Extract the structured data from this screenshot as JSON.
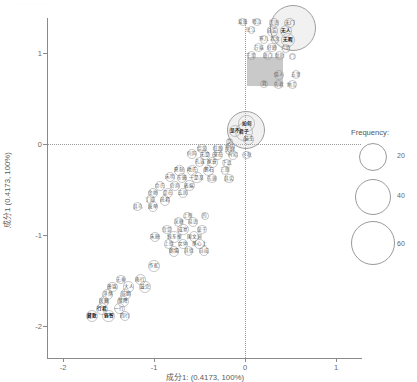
{
  "chart_data": {
    "type": "scatter",
    "title": "",
    "xlabel": "成分1: (0.4173, 100%)",
    "ylabel": "成分1 (0.4173, 100%)",
    "xlim": [
      -2.35,
      1.45
    ],
    "ylim": [
      -2.35,
      1.45
    ],
    "xticks": [
      "-2",
      "-1",
      "0",
      "1"
    ],
    "xtick_values": [
      -2,
      -1,
      0,
      1
    ],
    "yticks": [
      "1",
      "0",
      "-1",
      "-2"
    ],
    "ytick_values": [
      1,
      0,
      -1,
      -2
    ],
    "grid": false,
    "reference_lines": {
      "horizontal_at": 0,
      "vertical_at": 0,
      "style": "dotted"
    },
    "size_encoding": "Frequency",
    "legend": {
      "title": "Frequency:",
      "position": "right",
      "entries": [
        {
          "label": "20",
          "size": 20
        },
        {
          "label": "40",
          "size": 40
        },
        {
          "label": "60",
          "size": 60
        }
      ]
    },
    "points": [
      {
        "label": "爱耻",
        "x": -0.02,
        "y": 1.34,
        "freq": 6
      },
      {
        "label": "啜泣",
        "x": 0.13,
        "y": 1.34,
        "freq": 6
      },
      {
        "label": "言语",
        "x": 0.32,
        "y": 1.33,
        "freq": 10
      },
      {
        "label": "无门",
        "x": 0.49,
        "y": 1.33,
        "freq": 12
      },
      {
        "label": "往江",
        "x": 0.07,
        "y": 1.25,
        "freq": 6
      },
      {
        "label": "自忘",
        "x": 0.3,
        "y": 1.24,
        "freq": 14
      },
      {
        "label": "无人",
        "x": 0.45,
        "y": 1.24,
        "freq": 16
      },
      {
        "label": "寒儿",
        "x": 0.21,
        "y": 1.15,
        "freq": 8
      },
      {
        "label": "北文",
        "x": 0.33,
        "y": 1.15,
        "freq": 8
      },
      {
        "label": "无暇",
        "x": 0.47,
        "y": 1.14,
        "freq": 20
      },
      {
        "label": "万端",
        "x": 0.15,
        "y": 1.06,
        "freq": 8
      },
      {
        "label": "好峰",
        "x": 0.3,
        "y": 1.06,
        "freq": 10
      },
      {
        "label": "六官",
        "x": 0.45,
        "y": 1.05,
        "freq": 8
      },
      {
        "label": "千里",
        "x": 0.07,
        "y": 0.97,
        "freq": 8
      },
      {
        "label": "旅门",
        "x": 0.25,
        "y": 0.97,
        "freq": 8
      },
      {
        "label": "新时",
        "x": 0.38,
        "y": 0.97,
        "freq": 8
      },
      {
        "label": "门",
        "x": 0.52,
        "y": 0.96,
        "freq": 4
      },
      {
        "label": "儒人",
        "x": 0.37,
        "y": 0.76,
        "freq": 10
      },
      {
        "label": "去里",
        "x": 0.56,
        "y": 0.76,
        "freq": 8
      },
      {
        "label": "舞",
        "x": 0.21,
        "y": 0.66,
        "freq": 6
      },
      {
        "label": "先君",
        "x": 0.37,
        "y": 0.65,
        "freq": 8
      },
      {
        "label": "纳言",
        "x": 0.52,
        "y": 0.65,
        "freq": 8
      },
      {
        "label": "如何",
        "x": 0.02,
        "y": 0.22,
        "freq": 30
      },
      {
        "label": "君子",
        "x": -0.01,
        "y": 0.13,
        "freq": 34
      },
      {
        "label": "是不",
        "x": -0.11,
        "y": 0.14,
        "freq": 16
      },
      {
        "label": "脑王",
        "x": 0.04,
        "y": 0.05,
        "freq": 14
      },
      {
        "label": "是",
        "x": -0.17,
        "y": 0.02,
        "freq": 6
      },
      {
        "label": "约内",
        "x": -0.16,
        "y": -0.03,
        "freq": 8
      },
      {
        "label": "绍游",
        "x": -0.47,
        "y": -0.05,
        "freq": 10
      },
      {
        "label": "狂跟",
        "x": -0.3,
        "y": -0.05,
        "freq": 10
      },
      {
        "label": "夫妇",
        "x": -0.17,
        "y": -0.07,
        "freq": 8
      },
      {
        "label": "何阵",
        "x": -0.58,
        "y": -0.11,
        "freq": 10
      },
      {
        "label": "无是",
        "x": -0.44,
        "y": -0.12,
        "freq": 12
      },
      {
        "label": "豪在",
        "x": -0.3,
        "y": -0.12,
        "freq": 12
      },
      {
        "label": "有招",
        "x": -0.13,
        "y": -0.12,
        "freq": 10
      },
      {
        "label": "十秋",
        "x": 0.02,
        "y": -0.12,
        "freq": 8
      },
      {
        "label": "孔诚",
        "x": -0.5,
        "y": -0.2,
        "freq": 10
      },
      {
        "label": "家蓑",
        "x": -0.36,
        "y": -0.2,
        "freq": 12
      },
      {
        "label": "下武",
        "x": -0.2,
        "y": -0.21,
        "freq": 8
      },
      {
        "label": "夏刻",
        "x": -0.72,
        "y": -0.29,
        "freq": 12
      },
      {
        "label": "地氏",
        "x": -0.58,
        "y": -0.29,
        "freq": 12
      },
      {
        "label": "鹏石",
        "x": -0.4,
        "y": -0.29,
        "freq": 14
      },
      {
        "label": "三朋",
        "x": -0.22,
        "y": -0.29,
        "freq": 8
      },
      {
        "label": "未明",
        "x": -0.82,
        "y": -0.36,
        "freq": 10
      },
      {
        "label": "东骚",
        "x": -0.69,
        "y": -0.37,
        "freq": 10
      },
      {
        "label": "一是某",
        "x": -0.53,
        "y": -0.37,
        "freq": 14
      },
      {
        "label": "先旗",
        "x": -0.36,
        "y": -0.38,
        "freq": 10
      },
      {
        "label": "其实",
        "x": -0.18,
        "y": -0.38,
        "freq": 10
      },
      {
        "label": "命氏",
        "x": -0.93,
        "y": -0.46,
        "freq": 10
      },
      {
        "label": "官商",
        "x": -0.77,
        "y": -0.46,
        "freq": 10
      },
      {
        "label": "表端",
        "x": -0.61,
        "y": -0.46,
        "freq": 12
      },
      {
        "label": "金婵",
        "x": -1.01,
        "y": -0.54,
        "freq": 10
      },
      {
        "label": "是在",
        "x": -0.85,
        "y": -0.54,
        "freq": 10
      },
      {
        "label": "玄居",
        "x": -0.68,
        "y": -0.54,
        "freq": 10
      },
      {
        "label": "丁威",
        "x": -1.04,
        "y": -0.61,
        "freq": 8
      },
      {
        "label": "邑君",
        "x": -0.88,
        "y": -0.62,
        "freq": 12
      },
      {
        "label": "其乌",
        "x": -1.18,
        "y": -0.69,
        "freq": 8
      },
      {
        "label": "发单",
        "x": -1.01,
        "y": -0.69,
        "freq": 12
      },
      {
        "label": "上断",
        "x": -0.63,
        "y": -0.79,
        "freq": 8
      },
      {
        "label": "的",
        "x": -0.44,
        "y": -0.79,
        "freq": 6
      },
      {
        "label": "采糖",
        "x": -0.73,
        "y": -0.86,
        "freq": 10
      },
      {
        "label": "易语",
        "x": -0.57,
        "y": -0.86,
        "freq": 10
      },
      {
        "label": "宫觉",
        "x": -0.86,
        "y": -0.94,
        "freq": 10
      },
      {
        "label": "成宴",
        "x": -0.68,
        "y": -0.94,
        "freq": 14
      },
      {
        "label": "童干",
        "x": -0.47,
        "y": -0.94,
        "freq": 10
      },
      {
        "label": "朱糖",
        "x": -0.99,
        "y": -1.02,
        "freq": 10
      },
      {
        "label": "纯东掉",
        "x": -0.78,
        "y": -1.02,
        "freq": 14
      },
      {
        "label": "国文词",
        "x": -0.56,
        "y": -1.02,
        "freq": 12
      },
      {
        "label": "上德",
        "x": -0.84,
        "y": -1.1,
        "freq": 10
      },
      {
        "label": "女体",
        "x": -0.68,
        "y": -1.1,
        "freq": 10
      },
      {
        "label": "然心上",
        "x": -0.5,
        "y": -1.1,
        "freq": 12
      },
      {
        "label": "朝儒",
        "x": -0.78,
        "y": -1.18,
        "freq": 12
      },
      {
        "label": "其德",
        "x": -0.62,
        "y": -1.18,
        "freq": 10
      },
      {
        "label": "自成",
        "x": -0.45,
        "y": -1.18,
        "freq": 10
      },
      {
        "label": "作舵",
        "x": -1.0,
        "y": -1.34,
        "freq": 14
      },
      {
        "label": "无垂",
        "x": -1.36,
        "y": -1.49,
        "freq": 10
      },
      {
        "label": "南行",
        "x": -1.15,
        "y": -1.49,
        "freq": 14
      },
      {
        "label": "萧锦",
        "x": -1.46,
        "y": -1.57,
        "freq": 12
      },
      {
        "label": "大人",
        "x": -1.28,
        "y": -1.57,
        "freq": 14
      },
      {
        "label": "鼓完",
        "x": -1.1,
        "y": -1.57,
        "freq": 14
      },
      {
        "label": "浮然",
        "x": -1.51,
        "y": -1.65,
        "freq": 12
      },
      {
        "label": "局胆",
        "x": -1.31,
        "y": -1.65,
        "freq": 12
      },
      {
        "label": "居藏",
        "x": -1.55,
        "y": -1.73,
        "freq": 12
      },
      {
        "label": "焕降",
        "x": -1.34,
        "y": -1.73,
        "freq": 14
      },
      {
        "label": "行君",
        "x": -1.57,
        "y": -1.81,
        "freq": 16
      },
      {
        "label": "一行",
        "x": -1.38,
        "y": -1.81,
        "freq": 12
      },
      {
        "label": "藏散",
        "x": -1.68,
        "y": -1.89,
        "freq": 16
      },
      {
        "label": "弱智",
        "x": -1.5,
        "y": -1.89,
        "freq": 16
      },
      {
        "label": "四行",
        "x": -1.32,
        "y": -1.89,
        "freq": 12
      }
    ],
    "large_markers": [
      {
        "shape": "circle",
        "x": 0.53,
        "y": 1.27,
        "note": "dense overlapping cluster"
      },
      {
        "shape": "square",
        "x": 0.22,
        "y": 0.8,
        "note": "filled grey block"
      },
      {
        "shape": "circle",
        "x": 0.01,
        "y": 0.15,
        "note": "near origin cluster"
      }
    ]
  }
}
